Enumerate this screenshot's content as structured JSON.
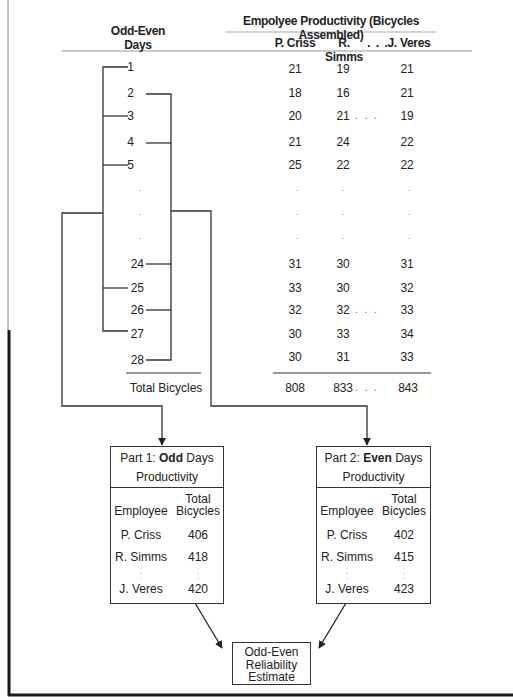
{
  "header": {
    "days_label_line1": "Odd-Even",
    "days_label_line2": "Days",
    "productivity_title": "Empolyee Productivity (Bicycles Assembled)",
    "employee_columns": [
      "P. Criss",
      "R. Simms",
      "J. Veres"
    ],
    "column_ellipsis": ". . ."
  },
  "rows": [
    {
      "day": "1",
      "values": [
        "21",
        "19",
        "21"
      ],
      "ellipsis": ""
    },
    {
      "day": "2",
      "values": [
        "18",
        "16",
        "21"
      ],
      "ellipsis": ""
    },
    {
      "day": "3",
      "values": [
        "20",
        "21",
        "19"
      ],
      "ellipsis": ". . ."
    },
    {
      "day": "4",
      "values": [
        "21",
        "24",
        "22"
      ],
      "ellipsis": ""
    },
    {
      "day": "5",
      "values": [
        "25",
        "22",
        "22"
      ],
      "ellipsis": ""
    },
    {
      "day": ".",
      "values": [
        ".",
        ".",
        "."
      ],
      "ellipsis": ""
    },
    {
      "day": ".",
      "values": [
        ".",
        ".",
        "."
      ],
      "ellipsis": ""
    },
    {
      "day": ".",
      "values": [
        ".",
        ".",
        "."
      ],
      "ellipsis": ""
    },
    {
      "day": "24",
      "values": [
        "31",
        "30",
        "31"
      ],
      "ellipsis": ""
    },
    {
      "day": "25",
      "values": [
        "33",
        "30",
        "32"
      ],
      "ellipsis": ""
    },
    {
      "day": "26",
      "values": [
        "32",
        "32",
        "33"
      ],
      "ellipsis": ". . ."
    },
    {
      "day": "27",
      "values": [
        "30",
        "33",
        "34"
      ],
      "ellipsis": ""
    },
    {
      "day": "28",
      "values": [
        "30",
        "31",
        "33"
      ],
      "ellipsis": ""
    }
  ],
  "totals": {
    "label": "Total Bicycles",
    "values": [
      "808",
      "833",
      "843"
    ],
    "ellipsis": ". . ."
  },
  "odd_box": {
    "title_prefix": "Part 1: ",
    "title_bold": "Odd",
    "title_suffix": " Days",
    "title_line2": "Productivity",
    "col_employee": "Employee",
    "col_total_line1": "Total",
    "col_total_line2": "Bicycles",
    "rows": [
      {
        "employee": "P. Criss",
        "total": "406"
      },
      {
        "employee": "R. Simms",
        "total": "418"
      },
      {
        "employee": "J. Veres",
        "total": "420"
      }
    ],
    "vertical_ellipsis": ":"
  },
  "even_box": {
    "title_prefix": "Part 2: ",
    "title_bold": "Even",
    "title_suffix": " Days",
    "title_line2": "Productivity",
    "col_employee": "Employee",
    "col_total_line1": "Total",
    "col_total_line2": "Bicycles",
    "rows": [
      {
        "employee": "P. Criss",
        "total": "402"
      },
      {
        "employee": "R. Simms",
        "total": "415"
      },
      {
        "employee": "J. Veres",
        "total": "423"
      }
    ],
    "vertical_ellipsis": ":"
  },
  "estimate_box": {
    "line1": "Odd-Even",
    "line2": "Reliability",
    "line3": "Estimate"
  },
  "colors": {
    "line": "#333333",
    "frame": "#1a1a1a",
    "thin_frame": "#8a8a8a",
    "rule": "#999999"
  }
}
